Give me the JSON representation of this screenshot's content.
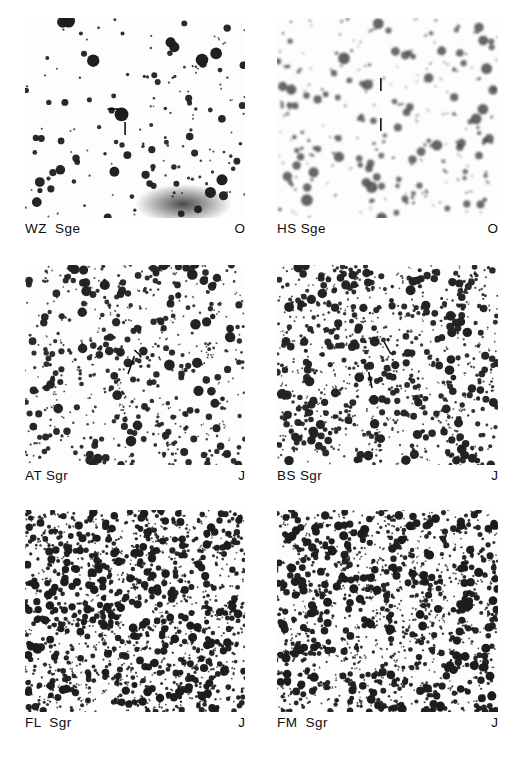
{
  "figure": {
    "type": "finder-chart-plate-grid",
    "background_color": "#ffffff",
    "ink_color": "#1a1a1a",
    "rows": 3,
    "columns": 2
  },
  "panels": [
    {
      "id": "wz-sge",
      "name": "WZ  Sge",
      "band": "O",
      "x": 25,
      "y": 18,
      "width": 220,
      "height": 200,
      "field_density": "sparse",
      "star_count": 150,
      "max_star_radius": 7.0,
      "min_star_radius": 1.0,
      "tone": "light",
      "seed": 11,
      "nebulosity": {
        "present": true,
        "cx": 0.72,
        "cy": 0.93,
        "rx": 0.22,
        "ry": 0.1
      },
      "marker": {
        "style": "dash-and-tick",
        "target_x": 0.455,
        "target_y": 0.455,
        "dash_x1": 0.375,
        "dash_y1": 0.455,
        "dash_x2": 0.425,
        "dash_y2": 0.455,
        "tick_x1": 0.455,
        "tick_y1": 0.52,
        "tick_x2": 0.455,
        "tick_y2": 0.585
      }
    },
    {
      "id": "hs-sge",
      "name": "HS Sge",
      "band": "O",
      "x": 277,
      "y": 18,
      "width": 221,
      "height": 200,
      "field_density": "moderate",
      "star_count": 230,
      "max_star_radius": 6.0,
      "min_star_radius": 1.0,
      "tone": "grey",
      "seed": 23,
      "nebulosity": {
        "present": false,
        "cx": 0.5,
        "cy": 0.5,
        "rx": 0.0,
        "ry": 0.0
      },
      "marker": {
        "style": "double-tick",
        "target_x": 0.47,
        "target_y": 0.47,
        "dash_x1": 0.47,
        "dash_y1": 0.3,
        "dash_x2": 0.47,
        "dash_y2": 0.365,
        "tick_x1": 0.47,
        "tick_y1": 0.5,
        "tick_x2": 0.47,
        "tick_y2": 0.565
      }
    },
    {
      "id": "at-sgr",
      "name": "AT Sgr",
      "band": "J",
      "x": 25,
      "y": 265,
      "width": 220,
      "height": 200,
      "field_density": "rich",
      "star_count": 520,
      "max_star_radius": 5.4,
      "min_star_radius": 0.9,
      "tone": "dark",
      "seed": 37,
      "nebulosity": {
        "present": false,
        "cx": 0.5,
        "cy": 0.5,
        "rx": 0.0,
        "ry": 0.0
      },
      "marker": {
        "style": "diagonal",
        "target_x": 0.5,
        "target_y": 0.5,
        "dash_x1": 0.497,
        "dash_y1": 0.425,
        "dash_x2": 0.527,
        "dash_y2": 0.455,
        "tick_x1": 0.497,
        "tick_y1": 0.455,
        "tick_x2": 0.468,
        "tick_y2": 0.545
      }
    },
    {
      "id": "bs-sgr",
      "name": "BS Sgr",
      "band": "J",
      "x": 277,
      "y": 265,
      "width": 221,
      "height": 200,
      "field_density": "very-rich",
      "star_count": 760,
      "max_star_radius": 5.0,
      "min_star_radius": 0.9,
      "tone": "dark",
      "seed": 53,
      "nebulosity": {
        "present": false,
        "cx": 0.5,
        "cy": 0.5,
        "rx": 0.0,
        "ry": 0.0
      },
      "marker": {
        "style": "diagonal",
        "target_x": 0.47,
        "target_y": 0.47,
        "dash_x1": 0.485,
        "dash_y1": 0.385,
        "dash_x2": 0.515,
        "dash_y2": 0.445,
        "tick_x1": 0.415,
        "tick_y1": 0.535,
        "tick_x2": 0.43,
        "tick_y2": 0.615
      }
    },
    {
      "id": "fl-sgr",
      "name": "FL  Sgr",
      "band": "J",
      "x": 25,
      "y": 510,
      "width": 220,
      "height": 202,
      "field_density": "crowded",
      "star_count": 1250,
      "max_star_radius": 4.4,
      "min_star_radius": 0.9,
      "tone": "very-dark",
      "seed": 71,
      "nebulosity": {
        "present": false,
        "cx": 0.5,
        "cy": 0.5,
        "rx": 0.0,
        "ry": 0.0
      },
      "marker": {
        "style": "none",
        "target_x": 0.5,
        "target_y": 0.5,
        "dash_x1": 0,
        "dash_y1": 0,
        "dash_x2": 0,
        "dash_y2": 0,
        "tick_x1": 0,
        "tick_y1": 0,
        "tick_x2": 0,
        "tick_y2": 0
      }
    },
    {
      "id": "fm-sgr",
      "name": "FM  Sgr",
      "band": "J",
      "x": 277,
      "y": 510,
      "width": 221,
      "height": 202,
      "field_density": "crowded",
      "star_count": 1150,
      "max_star_radius": 4.6,
      "min_star_radius": 0.9,
      "tone": "very-dark",
      "seed": 97,
      "nebulosity": {
        "present": false,
        "cx": 0.5,
        "cy": 0.5,
        "rx": 0.0,
        "ry": 0.0
      },
      "marker": {
        "style": "none",
        "target_x": 0.5,
        "target_y": 0.5,
        "dash_x1": 0,
        "dash_y1": 0,
        "dash_x2": 0,
        "dash_y2": 0,
        "tick_x1": 0,
        "tick_y1": 0,
        "tick_x2": 0,
        "tick_y2": 0
      }
    }
  ]
}
